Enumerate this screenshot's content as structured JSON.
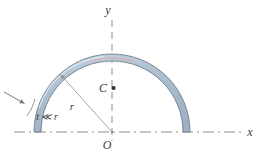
{
  "figure": {
    "background_color": "#ffffff",
    "labels": {
      "y_axis": "y",
      "x_axis": "x",
      "origin": "O",
      "centroid": "C",
      "radius": "r",
      "thickness": "t ≪ r"
    },
    "colors": {
      "band_fill": "#aebfd0",
      "band_fill_light": "#c6d2de",
      "band_stroke": "#6a7d8f",
      "axis": "#8a8a8a",
      "leader": "#9a9a9a",
      "label": "#3a3a3a",
      "highlight": "#e0a8b0"
    },
    "geometry": {
      "origin_x": 112,
      "origin_y": 132,
      "outer_radius": 78,
      "inner_radius": 71,
      "centroid_y": 88,
      "arc_start_deg": 0,
      "arc_end_deg": 180,
      "x_axis_y": 132,
      "y_axis_x": 112,
      "x_axis_right_end": 243,
      "y_axis_top_end": 20
    }
  }
}
